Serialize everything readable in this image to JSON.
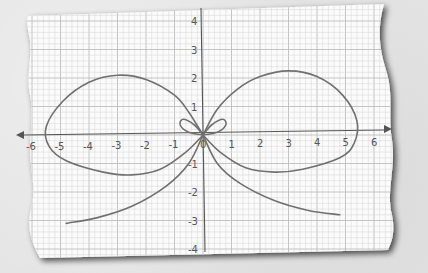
{
  "chart_data": {
    "type": "line",
    "title": "",
    "subtitle": "",
    "xlabel": "",
    "ylabel": "",
    "xlim": [
      -6,
      6
    ],
    "ylim": [
      -4,
      4
    ],
    "grid": true,
    "legend": null,
    "x_ticks": [
      "-6",
      "-5",
      "-4",
      "-3",
      "-2",
      "-1",
      "0",
      "1",
      "2",
      "3",
      "4",
      "5",
      "6"
    ],
    "y_ticks": [
      "4",
      "3",
      "2",
      "1",
      "-1",
      "-2",
      "-3",
      "-4"
    ],
    "series": [
      {
        "name": "left-large-lobe",
        "points": [
          [
            0,
            0
          ],
          [
            -0.5,
            0.8
          ],
          [
            -1,
            1.4
          ],
          [
            -2,
            1.95
          ],
          [
            -3,
            2.1
          ],
          [
            -4,
            1.85
          ],
          [
            -4.9,
            1.2
          ],
          [
            -5.5,
            0.3
          ],
          [
            -5.4,
            -0.4
          ],
          [
            -4.8,
            -0.9
          ],
          [
            -3.5,
            -1.3
          ],
          [
            -2.5,
            -1.4
          ],
          [
            -1.5,
            -1.2
          ],
          [
            -0.6,
            -0.6
          ],
          [
            0,
            0
          ]
        ]
      },
      {
        "name": "right-large-lobe",
        "points": [
          [
            0,
            0
          ],
          [
            0.5,
            0.9
          ],
          [
            1.2,
            1.6
          ],
          [
            2,
            2.05
          ],
          [
            3,
            2.25
          ],
          [
            4,
            2.05
          ],
          [
            4.9,
            1.4
          ],
          [
            5.4,
            0.5
          ],
          [
            5.3,
            -0.3
          ],
          [
            4.8,
            -0.8
          ],
          [
            3.5,
            -1.2
          ],
          [
            2.5,
            -1.3
          ],
          [
            1.5,
            -1.15
          ],
          [
            0.6,
            -0.6
          ],
          [
            0,
            0
          ]
        ]
      },
      {
        "name": "left-small-loop",
        "points": [
          [
            0,
            0
          ],
          [
            -0.3,
            0.35
          ],
          [
            -0.7,
            0.55
          ],
          [
            -0.8,
            0.35
          ],
          [
            -0.5,
            0.1
          ],
          [
            0,
            0
          ]
        ]
      },
      {
        "name": "right-small-loop",
        "points": [
          [
            0,
            0
          ],
          [
            0.3,
            0.35
          ],
          [
            0.7,
            0.55
          ],
          [
            0.8,
            0.35
          ],
          [
            0.5,
            0.1
          ],
          [
            0,
            0
          ]
        ]
      },
      {
        "name": "left-tail",
        "points": [
          [
            0,
            0
          ],
          [
            -0.5,
            -1
          ],
          [
            -1.3,
            -1.8
          ],
          [
            -2.5,
            -2.5
          ],
          [
            -3.7,
            -2.9
          ],
          [
            -4.8,
            -3.1
          ]
        ]
      },
      {
        "name": "right-tail",
        "points": [
          [
            0,
            0
          ],
          [
            0.5,
            -1
          ],
          [
            1.3,
            -1.7
          ],
          [
            2.5,
            -2.3
          ],
          [
            3.7,
            -2.65
          ],
          [
            4.8,
            -2.8
          ]
        ]
      }
    ]
  },
  "colors": {
    "paper": "#fbfbfb",
    "grid_minor": "#d4d4d4",
    "grid_major": "#bdbdbd",
    "axis": "#555555",
    "curve": "#707070",
    "background": "#e4e4e4",
    "shadow": "#3a3a3a"
  }
}
